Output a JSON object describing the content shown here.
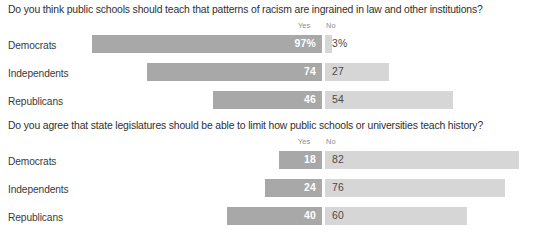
{
  "chart_data": [
    {
      "type": "bar",
      "title": "Do you think public schools should teach that patterns of racism are ingrained in law and other institutions?",
      "xlabel": "",
      "ylabel": "",
      "xlim": [
        0,
        100
      ],
      "grid": false,
      "legend_position": "top-center",
      "orientation": "horizontal-diverging",
      "legend": [
        "Yes",
        "No"
      ],
      "categories": [
        "Democrats",
        "Independents",
        "Republicans"
      ],
      "series": [
        {
          "name": "Yes",
          "values": [
            97,
            74,
            46
          ],
          "labels": [
            "97%",
            "74",
            "46"
          ],
          "color": "#a8a8a8"
        },
        {
          "name": "No",
          "values": [
            3,
            27,
            54
          ],
          "labels": [
            "3%",
            "27",
            "54"
          ],
          "color": "#d6d6d6"
        }
      ]
    },
    {
      "type": "bar",
      "title": "Do you agree that state legislatures should be able to limit how public schools or universities teach history?",
      "xlabel": "",
      "ylabel": "",
      "xlim": [
        0,
        100
      ],
      "grid": false,
      "legend_position": "top-center",
      "orientation": "horizontal-diverging",
      "legend": [
        "Yes",
        "No"
      ],
      "categories": [
        "Democrats",
        "Independents",
        "Republicans"
      ],
      "series": [
        {
          "name": "Yes",
          "values": [
            18,
            24,
            40
          ],
          "labels": [
            "18",
            "24",
            "40"
          ],
          "color": "#a8a8a8"
        },
        {
          "name": "No",
          "values": [
            82,
            76,
            60
          ],
          "labels": [
            "82",
            "76",
            "60"
          ],
          "color": "#d6d6d6"
        }
      ]
    }
  ],
  "charts": [
    {
      "title": "Do you think public schools should teach that patterns of racism are ingrained in law and other institutions?",
      "header_yes": "Yes",
      "header_no": "No",
      "rows": [
        {
          "label": "Democrats",
          "yes_value": 97,
          "no_value": 3,
          "yes_label": "97%",
          "no_label": "3%"
        },
        {
          "label": "Independents",
          "yes_value": 74,
          "no_value": 27,
          "yes_label": "74",
          "no_label": "27"
        },
        {
          "label": "Republicans",
          "yes_value": 46,
          "no_value": 54,
          "yes_label": "46",
          "no_label": "54"
        }
      ]
    },
    {
      "title": "Do you agree that state legislatures should be able to limit how public schools or universities teach history?",
      "header_yes": "Yes",
      "header_no": "No",
      "rows": [
        {
          "label": "Democrats",
          "yes_value": 18,
          "no_value": 82,
          "yes_label": "18",
          "no_label": "82"
        },
        {
          "label": "Independents",
          "yes_value": 24,
          "no_value": 76,
          "yes_label": "24",
          "no_label": "76"
        },
        {
          "label": "Republicans",
          "yes_value": 40,
          "no_value": 60,
          "yes_label": "40",
          "no_label": "60"
        }
      ]
    }
  ],
  "colors": {
    "yes_bar": "#a8a8a8",
    "no_bar": "#d6d6d6",
    "yes_text": "#ffffff",
    "no_text": "#4a4a4a",
    "title_text": "#2f2f2f",
    "header_text": "#8c8c8c",
    "background": "#ffffff"
  }
}
